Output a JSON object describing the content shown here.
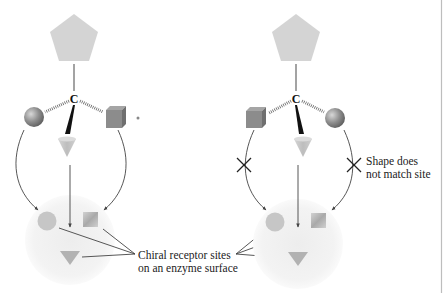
{
  "figure": {
    "left_panel": {
      "central_atom": "C",
      "substituents": [
        "pentagon",
        "sphere",
        "cube",
        "cone"
      ],
      "binding": "all three groups match receptor sites"
    },
    "right_panel": {
      "central_atom": "C",
      "substituents": [
        "pentagon",
        "cube",
        "sphere",
        "cone"
      ],
      "binding": "mirror image; two groups do not match"
    },
    "labels": {
      "receptor_line1": "Chiral receptor sites",
      "receptor_line2": "on an enzyme surface",
      "mismatch_line1": "Shape does",
      "mismatch_line2": "not match site"
    },
    "icons": {
      "mismatch": "x-mark-icon",
      "arrow": "arrow-icon"
    },
    "colors": {
      "pentagon": "#d4d4d4",
      "sphere": "#8a8a8a",
      "cube": "#8c8c8c",
      "cone": "#c8c8c8",
      "enzyme_surface": "#f1f1f1",
      "site": "#c4c4c4",
      "line": "#555555",
      "border": "#bdbdbd"
    }
  }
}
